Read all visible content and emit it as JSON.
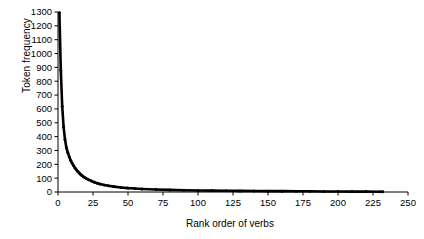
{
  "chart_data": {
    "type": "line",
    "title": "",
    "xlabel": "Rank order of verbs",
    "ylabel": "Token frequency",
    "xlim": [
      0,
      250
    ],
    "ylim": [
      0,
      1300
    ],
    "xticks": [
      0,
      25,
      50,
      75,
      100,
      125,
      150,
      175,
      200,
      225,
      250
    ],
    "yticks": [
      0,
      100,
      200,
      300,
      400,
      500,
      600,
      700,
      800,
      900,
      1000,
      1100,
      1200,
      1300
    ],
    "grid": false,
    "legend": null,
    "series": [
      {
        "name": "Verb token frequency by rank",
        "x": [
          1,
          2,
          3,
          4,
          5,
          6,
          7,
          8,
          9,
          10,
          11,
          12,
          13,
          14,
          15,
          16,
          17,
          18,
          19,
          20,
          22,
          24,
          26,
          28,
          30,
          33,
          36,
          40,
          45,
          50,
          55,
          60,
          70,
          80,
          90,
          100,
          110,
          120,
          130,
          140,
          150,
          160,
          170,
          180,
          190,
          200,
          210,
          220,
          230,
          232
        ],
        "values": [
          1295,
          880,
          620,
          470,
          380,
          320,
          285,
          255,
          230,
          210,
          192,
          176,
          162,
          150,
          139,
          129,
          120,
          112,
          105,
          99,
          88,
          79,
          71,
          64,
          58,
          51,
          45,
          39,
          33,
          28,
          25,
          22,
          18,
          15,
          13,
          11,
          10,
          9,
          8,
          7,
          6,
          6,
          5,
          5,
          4,
          4,
          3,
          3,
          2,
          2
        ]
      }
    ]
  }
}
